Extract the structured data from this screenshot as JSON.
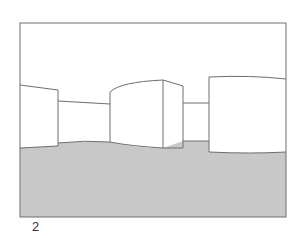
{
  "figure": {
    "label": "2",
    "colors": {
      "ground": "#c8c8c8",
      "stroke": "#6e6e6e",
      "background": "#ffffff"
    }
  }
}
